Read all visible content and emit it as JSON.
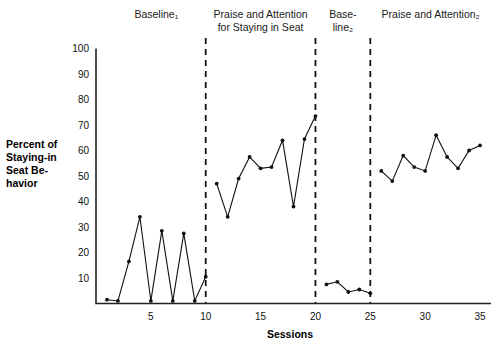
{
  "chart_data": {
    "type": "line",
    "title": "",
    "xlabel": "Sessions",
    "ylabel": "Percent of Staying-in Seat Be-havior",
    "ylabel_lines": [
      "Percent of",
      "Staying-in",
      "Seat Be-",
      "havior"
    ],
    "xlim": [
      0,
      36
    ],
    "ylim": [
      0,
      100
    ],
    "grid": false,
    "legend": "none",
    "yticks": [
      10,
      20,
      30,
      40,
      50,
      60,
      70,
      80,
      90,
      100
    ],
    "ytick_labels": [
      "10",
      "20",
      "30",
      "40",
      "50",
      "60",
      "70",
      "80",
      "90",
      "100"
    ],
    "xticks": [
      5,
      10,
      15,
      20,
      25,
      30,
      35
    ],
    "xtick_labels": [
      "5",
      "10",
      "15",
      "20",
      "25",
      "30",
      "35"
    ],
    "phase_change_lines": [
      10,
      20,
      25
    ],
    "phases": [
      {
        "id": "baseline-1",
        "label": "Baseline",
        "subscript": "1",
        "label_lines": [
          "Baseline₁"
        ],
        "center_session": 5.5,
        "x": [
          1,
          2,
          3,
          4,
          5,
          6,
          7,
          8,
          9,
          10
        ],
        "y": [
          1.5,
          1.0,
          16.5,
          34.0,
          1.0,
          28.5,
          1.0,
          27.5,
          1.0,
          10.5
        ]
      },
      {
        "id": "praise-attention-1",
        "label": "Praise and Attention for Staying in Seat",
        "subscript": "",
        "label_lines": [
          "Praise and Attention",
          "for Staying in Seat"
        ],
        "center_session": 15,
        "x": [
          11,
          12,
          13,
          14,
          15,
          16,
          17,
          18,
          19,
          20
        ],
        "y": [
          47.0,
          34.0,
          49.0,
          57.5,
          53.0,
          53.5,
          64.0,
          38.0,
          64.5,
          73.5
        ]
      },
      {
        "id": "baseline-2",
        "label": "Base-line",
        "subscript": "2",
        "label_lines": [
          "Base-",
          "line₂"
        ],
        "center_session": 22.5,
        "x": [
          21,
          22,
          23,
          24,
          25
        ],
        "y": [
          7.5,
          8.5,
          4.5,
          5.5,
          4.0
        ]
      },
      {
        "id": "praise-attention-2",
        "label": "Praise and Attention",
        "subscript": "2",
        "label_lines": [
          "Praise and Attention₂"
        ],
        "center_session": 30.5,
        "x": [
          26,
          27,
          28,
          29,
          30,
          31,
          32,
          33,
          34,
          35
        ],
        "y": [
          52.0,
          48.0,
          58.0,
          53.5,
          52.0,
          66.0,
          57.5,
          53.0,
          60.0,
          62.0
        ]
      }
    ],
    "colors": {
      "line": "#111111",
      "marker": "#111111",
      "axis": "#222222",
      "phase_divider": "#111111",
      "background": "#ffffff"
    }
  }
}
